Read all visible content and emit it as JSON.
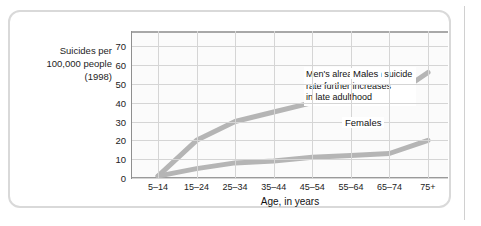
{
  "chart_data": {
    "type": "line",
    "title": "",
    "subtitle": "",
    "xlabel": "Age, in years",
    "ylabel": "Suicides per 100,000 people (1998)",
    "categories": [
      "5–14",
      "15–24",
      "25–34",
      "35–44",
      "45–54",
      "55–64",
      "65–74",
      "75+"
    ],
    "yticks": [
      0,
      10,
      20,
      30,
      40,
      50,
      60,
      70
    ],
    "ylim": [
      0,
      78
    ],
    "grid": true,
    "legend_position": "inline-labels",
    "series": [
      {
        "name": "Males",
        "color": "#b5b5b5",
        "values": [
          1,
          20,
          30,
          35,
          40,
          42,
          42,
          56
        ]
      },
      {
        "name": "Females",
        "color": "#b5b5b5",
        "values": [
          1,
          5,
          8,
          9,
          11,
          12,
          13,
          20
        ]
      }
    ],
    "annotations": [
      {
        "name": "men-rate-note",
        "text": "Men's already-high suicide\nrate further increases\nin late adulthood"
      }
    ]
  },
  "axis": {
    "y_caption_lines": [
      "Suicides per",
      "100,000 people",
      "(1998)"
    ],
    "y_caption_line1": "Suicides per",
    "y_caption_line2": "100,000 people",
    "y_caption_line3": "(1998)",
    "x_title": "Age, in years"
  },
  "labels": {
    "males": "Males",
    "females": "Females",
    "note": "Men's already-high suicide\nrate further increases\nin late adulthood"
  },
  "colors": {
    "series_line": "#b5b5b5",
    "grid": "#d5d5d5",
    "axis": "#9a9a9a",
    "frame": "#d9d9d9",
    "plot_background": "#fbfbfb",
    "text": "#1d1d1d"
  }
}
